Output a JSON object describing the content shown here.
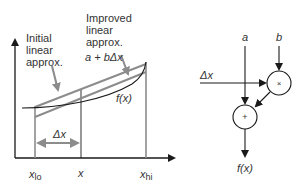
{
  "left_panel": {
    "annotations": {
      "initial": [
        "Initial",
        "linear",
        "approx."
      ],
      "improved": [
        "Improved",
        "linear",
        "approx."
      ],
      "improved_formula": "a + bΔx"
    },
    "curve_label": "f(x)",
    "delta_label": "Δx",
    "x_ticks": {
      "lo": "x",
      "lo_sub": "lo",
      "mid": "x",
      "hi": "x",
      "hi_sub": "hi"
    }
  },
  "right_panel": {
    "inputs": {
      "a": "a",
      "b": "b",
      "delta_x": "Δx"
    },
    "nodes": {
      "multiply": "×",
      "add": "+"
    },
    "output": "f(x)"
  },
  "colors": {
    "axis": "#1a1a1a",
    "approx_line": "#8c8c8c",
    "curve": "#1a1a1a",
    "text": "#333333"
  }
}
